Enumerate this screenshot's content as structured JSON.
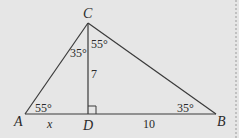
{
  "colors": {
    "background": "#e6e6e6",
    "stroke": "#3a3a3a",
    "border": "#9a9a9a"
  },
  "points": {
    "A": {
      "label": "A",
      "x": 25,
      "y": 114
    },
    "B": {
      "label": "B",
      "x": 216,
      "y": 114
    },
    "C": {
      "label": "C",
      "x": 88,
      "y": 23
    },
    "D": {
      "label": "D",
      "x": 88,
      "y": 114
    }
  },
  "angles": {
    "A": "55°",
    "B": "35°",
    "ACD": "35°",
    "DCB": "55°"
  },
  "lengths": {
    "AD": "x",
    "CD": "7",
    "DB": "10"
  },
  "right_angle_at": "D"
}
